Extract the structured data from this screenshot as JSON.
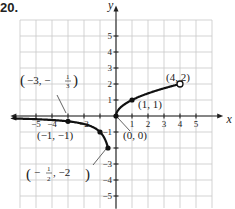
{
  "problem_number": "20.",
  "chart_data": {
    "type": "line",
    "title": "",
    "xlabel": "x",
    "ylabel": "y",
    "xlim": [
      -6,
      6
    ],
    "ylim": [
      -6,
      6
    ],
    "grid": true,
    "x_ticks": [
      "-5",
      "-4",
      "-2",
      "1",
      "2",
      "3",
      "4",
      "5"
    ],
    "y_ticks": [
      "5",
      "4",
      "3",
      "2",
      "1",
      "-1",
      "-3",
      "-4",
      "-5"
    ],
    "series": [
      {
        "name": "left branch",
        "x": [
          -6,
          -5,
          -4,
          -3,
          -2,
          -1,
          -0.5
        ],
        "y": [
          -0.17,
          -0.2,
          -0.25,
          -0.333,
          -0.5,
          -1,
          -2
        ],
        "left_arrow": true,
        "end": "closed"
      },
      {
        "name": "right branch",
        "x": [
          0,
          0.25,
          1,
          2,
          3,
          4
        ],
        "y": [
          0,
          0.5,
          1,
          1.414,
          1.732,
          2
        ],
        "start": "closed",
        "end": "open"
      }
    ],
    "annotations": [
      {
        "point": [
          -3,
          -0.333
        ],
        "label": "(−3, −1/3)"
      },
      {
        "point": [
          -1,
          -1
        ],
        "label": "(−1, −1)"
      },
      {
        "point": [
          -0.5,
          -2
        ],
        "label": "(−1/2, −2)"
      },
      {
        "point": [
          0,
          0
        ],
        "label": "(0, 0)"
      },
      {
        "point": [
          1,
          1
        ],
        "label": "(1, 1)"
      },
      {
        "point": [
          4,
          2
        ],
        "label": "(4, 2)"
      }
    ]
  }
}
